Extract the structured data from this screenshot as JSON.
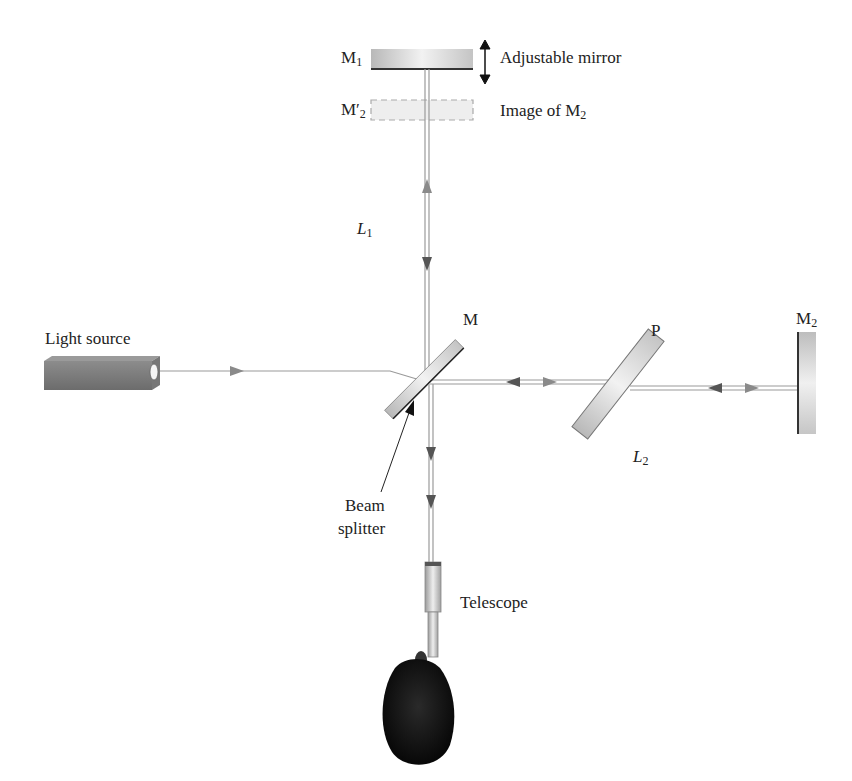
{
  "diagram": {
    "labels": {
      "m1": "M",
      "m1_sub": "1",
      "adjustable_mirror": "Adjustable mirror",
      "m2_prime": "M′",
      "m2_prime_sub": "2",
      "image_of_m2": "Image of M",
      "image_of_m2_sub": "2",
      "l1": "L",
      "l1_sub": "1",
      "m": "M",
      "light_source": "Light source",
      "p": "P",
      "m2": "M",
      "m2_sub": "2",
      "l2": "L",
      "l2_sub": "2",
      "beam_splitter_line1": "Beam",
      "beam_splitter_line2": "splitter",
      "telescope": "Telescope"
    },
    "colors": {
      "beam": "#9a9a9a",
      "arrow_dark": "#555555",
      "arrow_light": "#8a8a8a",
      "mirror_fill": "#cfcfcf",
      "head": "#111111"
    }
  }
}
